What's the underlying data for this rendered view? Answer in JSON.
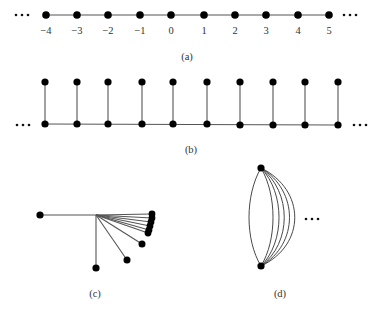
{
  "panels": {
    "a": {
      "caption": "(a)",
      "description": "Infinite path on the integers",
      "labels": [
        "−4",
        "−3",
        "−2",
        "−1",
        "0",
        "1",
        "2",
        "3",
        "4",
        "5"
      ]
    },
    "b": {
      "caption": "(b)",
      "description": "Infinite comb: path with a pendant vertex at each node",
      "node_count": 10
    },
    "c": {
      "caption": "(c)",
      "description": "Hub vertex with a left edge, a downward edge, and a fan of edges accumulating toward the horizontal"
    },
    "d": {
      "caption": "(d)",
      "description": "Two vertices joined by infinitely many parallel edges"
    }
  }
}
